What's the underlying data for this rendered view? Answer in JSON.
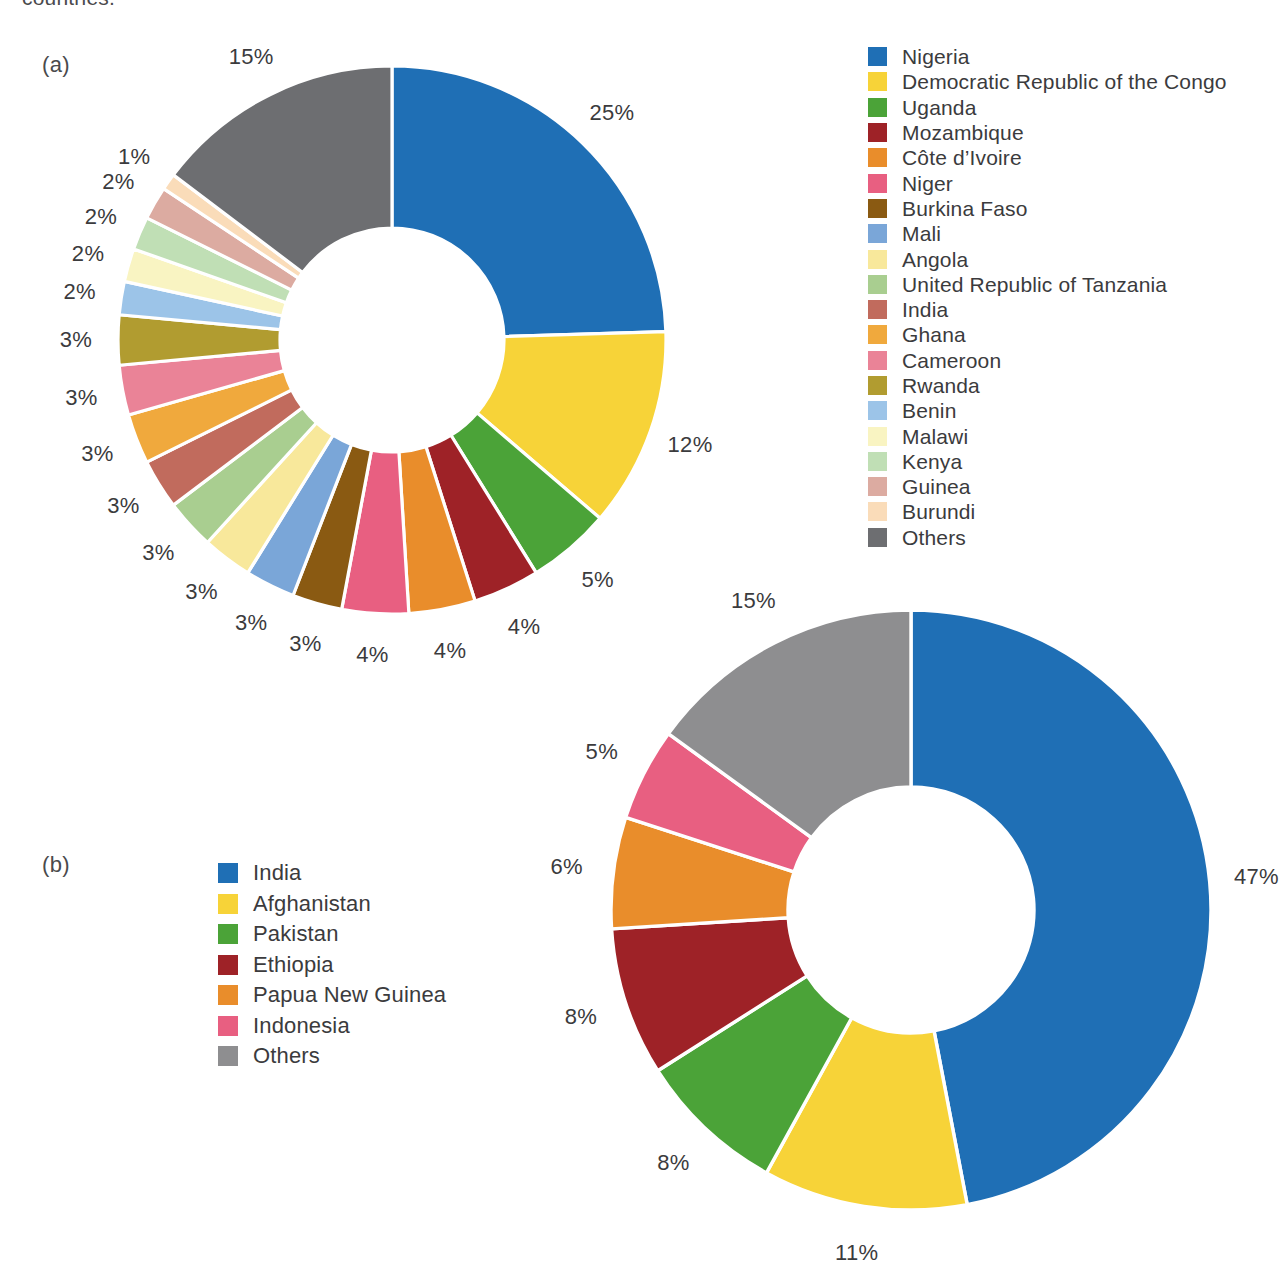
{
  "clipped_caption": "countries.",
  "panels": {
    "a": {
      "tag": "(a)"
    },
    "b": {
      "tag": "(b)"
    }
  },
  "chart_data": [
    {
      "id": "chart-a",
      "type": "pie",
      "variant": "donut",
      "title": "",
      "panel": "(a)",
      "legend_position": "right",
      "start_angle_deg": 0,
      "direction": "clockwise",
      "units": "percent",
      "categories": [
        "Nigeria",
        "Democratic Republic of the Congo",
        "Uganda",
        "Mozambique",
        "Côte d’Ivoire",
        "Niger",
        "Burkina Faso",
        "Mali",
        "Angola",
        "United Republic of Tanzania",
        "India",
        "Ghana",
        "Cameroon",
        "Rwanda",
        "Benin",
        "Malawi",
        "Kenya",
        "Guinea",
        "Burundi",
        "Others"
      ],
      "values": [
        25,
        12,
        5,
        4,
        4,
        4,
        3,
        3,
        3,
        3,
        3,
        3,
        3,
        3,
        2,
        2,
        2,
        2,
        1,
        15
      ],
      "data_labels": [
        "25%",
        "12%",
        "5%",
        "4%",
        "4%",
        "4%",
        "3%",
        "3%",
        "3%",
        "3%",
        "3%",
        "3%",
        "3%",
        "3%",
        "2%",
        "2%",
        "2%",
        "2%",
        "1%",
        "15%"
      ],
      "colors": [
        "#1f6fb5",
        "#f7d338",
        "#4ba338",
        "#9e2227",
        "#e98d2b",
        "#e85f81",
        "#8a5a12",
        "#7aa6d8",
        "#f8e89b",
        "#a9ce90",
        "#c16b5d",
        "#f0a93d",
        "#ea8397",
        "#b19c30",
        "#9cc4e8",
        "#f9f4c2",
        "#c0dfb5",
        "#dcaba1",
        "#fadcb9",
        "#6d6e71"
      ]
    },
    {
      "id": "chart-b",
      "type": "pie",
      "variant": "donut",
      "title": "",
      "panel": "(b)",
      "legend_position": "left",
      "start_angle_deg": 0,
      "direction": "clockwise",
      "units": "percent",
      "categories": [
        "India",
        "Afghanistan",
        "Pakistan",
        "Ethiopia",
        "Papua New Guinea",
        "Indonesia",
        "Others"
      ],
      "values": [
        47,
        11,
        8,
        8,
        6,
        5,
        15
      ],
      "data_labels": [
        "47%",
        "11%",
        "8%",
        "8%",
        "6%",
        "5%",
        "15%"
      ],
      "colors": [
        "#1f6fb5",
        "#f7d338",
        "#4ba338",
        "#9e2227",
        "#e98d2b",
        "#e85f81",
        "#8e8e90"
      ]
    }
  ]
}
